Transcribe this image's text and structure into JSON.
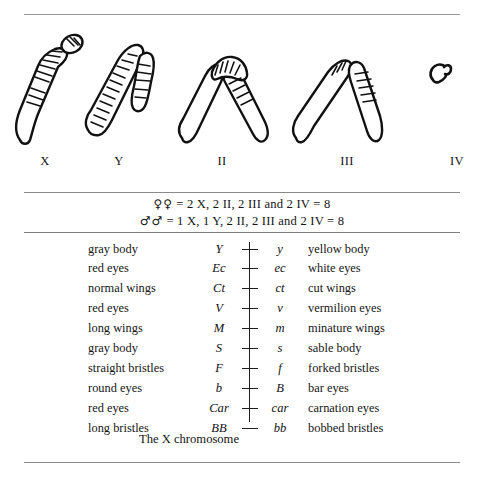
{
  "figure": {
    "chromosomes": [
      {
        "label": "X",
        "icon": "chromosome-x-icon",
        "shape": "rod-with-hooked-banded-arm"
      },
      {
        "label": "Y",
        "icon": "chromosome-y-icon",
        "shape": "banded-arch"
      },
      {
        "label": "II",
        "icon": "chromosome-ii-icon",
        "shape": "v-shaped-metacentric"
      },
      {
        "label": "III",
        "icon": "chromosome-iii-icon",
        "shape": "v-shaped-metacentric"
      },
      {
        "label": "IV",
        "icon": "chromosome-iv-icon",
        "shape": "dot"
      }
    ]
  },
  "formulas": [
    {
      "symbol": "♀♀",
      "text": "= 2 X, 2 II, 2 III and 2 IV = 8"
    },
    {
      "symbol": "♂♂",
      "text": "= 1 X, 1 Y, 2 II, 2 III and 2 IV = 8"
    }
  ],
  "gene_table": {
    "rows": [
      {
        "dominant_phenotype": "gray body",
        "dominant_allele": "Y",
        "recessive_allele": "y",
        "recessive_phenotype": "yellow body"
      },
      {
        "dominant_phenotype": "red eyes",
        "dominant_allele": "Ec",
        "recessive_allele": "ec",
        "recessive_phenotype": "white eyes"
      },
      {
        "dominant_phenotype": "normal wings",
        "dominant_allele": "Ct",
        "recessive_allele": "ct",
        "recessive_phenotype": "cut wings"
      },
      {
        "dominant_phenotype": "red eyes",
        "dominant_allele": "V",
        "recessive_allele": "v",
        "recessive_phenotype": "vermilion eyes"
      },
      {
        "dominant_phenotype": "long wings",
        "dominant_allele": "M",
        "recessive_allele": "m",
        "recessive_phenotype": "minature wings"
      },
      {
        "dominant_phenotype": "gray body",
        "dominant_allele": "S",
        "recessive_allele": "s",
        "recessive_phenotype": "sable body"
      },
      {
        "dominant_phenotype": "straight bristles",
        "dominant_allele": "F",
        "recessive_allele": "f",
        "recessive_phenotype": "forked bristles"
      },
      {
        "dominant_phenotype": "round eyes",
        "dominant_allele": "b",
        "recessive_allele": "B",
        "recessive_phenotype": "bar eyes"
      },
      {
        "dominant_phenotype": "red eyes",
        "dominant_allele": "Car",
        "recessive_allele": "car",
        "recessive_phenotype": "carnation eyes"
      },
      {
        "dominant_phenotype": "long bristles",
        "dominant_allele": "BB",
        "recessive_allele": "bb",
        "recessive_phenotype": "bobbed bristles"
      }
    ]
  },
  "caption": "The X chromosome",
  "colors": {
    "ink": "#1a1a1a",
    "rule": "#8a8a8a",
    "background": "#ffffff"
  }
}
